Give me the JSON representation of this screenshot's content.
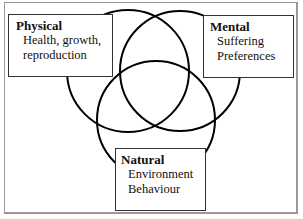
{
  "diagram": {
    "type": "venn",
    "circles": [
      {
        "id": "physical",
        "cx": 128,
        "cy": 71,
        "r": 61
      },
      {
        "id": "mental",
        "cx": 180,
        "cy": 71,
        "r": 60
      },
      {
        "id": "natural",
        "cx": 156,
        "cy": 120,
        "r": 59
      }
    ],
    "boxes": {
      "physical": {
        "title": "Physical",
        "lines": [
          "Health, growth,",
          "reproduction"
        ]
      },
      "mental": {
        "title": "Mental",
        "lines": [
          "Suffering",
          "Preferences"
        ]
      },
      "natural": {
        "title": "Natural",
        "lines": [
          "Environment",
          "Behaviour"
        ]
      }
    },
    "colors": {
      "stroke": "#000000",
      "frame": "#9a9a9a",
      "background": "#ffffff"
    }
  }
}
